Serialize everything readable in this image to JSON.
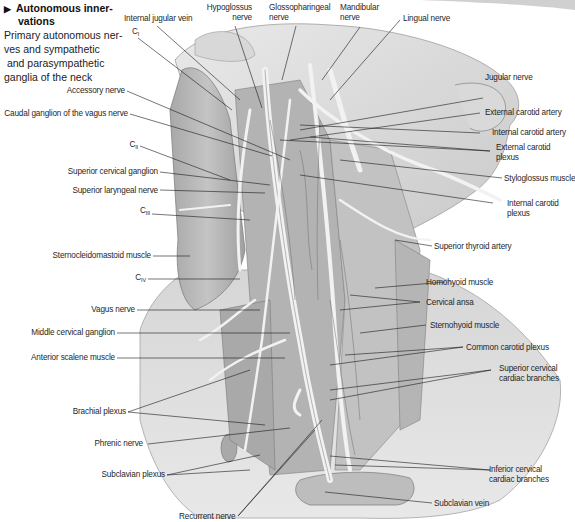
{
  "heading": {
    "arrow": "▶",
    "title_line1": "Autonomous inner-",
    "title_line2": "vations",
    "subtitle_lines": [
      "Primary autonomous ner-",
      "ves and sympathetic",
      " and parasympathetic",
      "ganglia of the neck"
    ]
  },
  "labels": {
    "internal_jugular_vein": "Internal jugular vein",
    "c1_base": "C",
    "c1_sub": "I",
    "hypoglossus_1": "Hypoglossus",
    "hypoglossus_2": "nerve",
    "glossopharyngeal_1": "Glossopharingeal",
    "glossopharyngeal_2": "nerve",
    "mandibular_1": "Mandibular",
    "mandibular_2": "nerve",
    "lingual_nerve": "Lingual nerve",
    "jugular_nerve": "Jugular nerve",
    "external_carotid_artery": "External carotid artery",
    "internal_carotid_artery": "Internal carotid artery",
    "external_carotid_plexus_1": "External carotid",
    "external_carotid_plexus_2": "plexus",
    "styloglossus_muscle": "Styloglossus muscle",
    "internal_carotid_plexus_1": "Internal carotid",
    "internal_carotid_plexus_2": "plexus",
    "superior_thyroid_artery": "Superior thyroid artery",
    "homohyoid_muscle": "Homohyoid muscle",
    "cervical_ansa": "Cervical ansa",
    "sternohyoid_muscle": "Sternohyoid muscle",
    "common_carotid_plexus": "Common carotid plexus",
    "superior_cervical_cardiac_1": "Superior cervical",
    "superior_cervical_cardiac_2": "cardiac branches",
    "inferior_cervical_cardiac_1": "Inferior cervical",
    "inferior_cervical_cardiac_2": "cardiac branches",
    "subclavian_vein": "Subclavian vein",
    "recurrent_nerve": "Recurrent nerve",
    "accessory_nerve": "Accessory nerve",
    "caudal_ganglion_vagus": "Caudal ganglion of the vagus nerve",
    "c2_base": "C",
    "c2_sub": "II",
    "superior_cervical_ganglion": "Superior cervical ganglion",
    "superior_laryngeal_nerve": "Superior laryngeal nerve",
    "c3_base": "C",
    "c3_sub": "III",
    "sternocleidomastoid_muscle": "Sternocleidomastoid muscle",
    "c4_base": "C",
    "c4_sub": "IV",
    "vagus_nerve": "Vagus nerve",
    "middle_cervical_ganglion": "Middle cervical ganglion",
    "anterior_scalene_muscle": "Anterior scalene muscle",
    "brachial_plexus": "Brachial plexus",
    "phrenic_nerve": "Phrenic nerve",
    "subclavian_plexus": "Subclavian plexus"
  },
  "colors": {
    "background": "#ffffff",
    "skin_light": "#e4e4e4",
    "skin_mid": "#cfcfcf",
    "muscle": "#b9b9b9",
    "muscle_dark": "#9a9a9a",
    "nerve": "#f2f2f2",
    "leader_line": "#1a1a1a"
  }
}
